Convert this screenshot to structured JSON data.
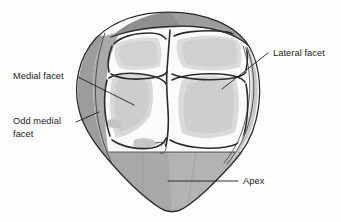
{
  "figure": {
    "background_color": "#fefefe",
    "colors": {
      "outline": "#2a2a2a",
      "facet_border": "#2b2b2b",
      "rim_dark_gray": "#9a9a9a",
      "rim_mid_gray": "#ababab",
      "apex_gray": "#a5a5a5",
      "apex_gray_light": "#b4b4b4",
      "facet_shade_light": "#dcdcdc",
      "facet_shade_mid": "#cfcfcf",
      "facet_white": "#fbfbfb",
      "leader_line": "#1d1d1d",
      "label_text": "#1b1b1b"
    },
    "labels": [
      {
        "id": "lateral-facet",
        "lines": [
          "Lateral facet"
        ],
        "text_anchor": "start",
        "x": 273,
        "y": 56,
        "leader": {
          "x1": 268,
          "y1": 53,
          "x2": 222,
          "y2": 89
        }
      },
      {
        "id": "medial-facet",
        "lines": [
          "Medial facet"
        ],
        "text_anchor": "start",
        "x": 13,
        "y": 79,
        "leader": {
          "x1": 78,
          "y1": 77,
          "x2": 134,
          "y2": 105
        }
      },
      {
        "id": "odd-medial-facet",
        "lines": [
          "Odd medial",
          "facet"
        ],
        "text_anchor": "start",
        "x": 13,
        "y": 124,
        "leader": {
          "x1": 76,
          "y1": 122,
          "x2": 99,
          "y2": 112
        }
      },
      {
        "id": "apex",
        "lines": [
          "Apex"
        ],
        "text_anchor": "start",
        "x": 243,
        "y": 184,
        "leader": {
          "x1": 238,
          "y1": 181,
          "x2": 168,
          "y2": 181
        }
      }
    ],
    "regions": [
      {
        "id": "superomedial-facet",
        "name": "Superior medial facet",
        "quadrant": "upper-left"
      },
      {
        "id": "superolateral-facet",
        "name": "Superior lateral facet",
        "quadrant": "upper-right"
      },
      {
        "id": "inferomedial-facet",
        "name": "Inferior medial facet",
        "quadrant": "lower-left"
      },
      {
        "id": "inferolateral-facet",
        "name": "Inferior lateral facet",
        "quadrant": "lower-right"
      },
      {
        "id": "odd-medial-strip",
        "name": "Odd medial facet strip",
        "quadrant": "left-rim"
      },
      {
        "id": "apex-region",
        "name": "Apex",
        "quadrant": "bottom"
      }
    ]
  }
}
